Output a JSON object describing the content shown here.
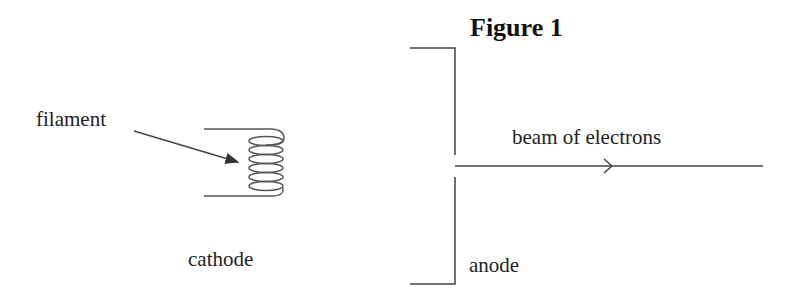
{
  "figure": {
    "title": "Figure 1",
    "labels": {
      "filament": "filament",
      "cathode": "cathode",
      "anode": "anode",
      "beam": "beam of electrons"
    },
    "colors": {
      "stroke": "#444444",
      "text": "#222222",
      "background": "#ffffff"
    }
  }
}
